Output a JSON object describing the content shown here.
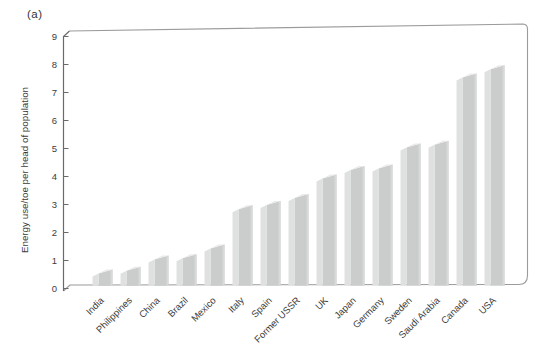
{
  "chart_data": {
    "type": "bar",
    "panel_label": "(a)",
    "title": "",
    "xlabel": "",
    "ylabel": "Energy use/toe per head of population",
    "categories": [
      "India",
      "Philippines",
      "China",
      "Brazil",
      "Mexico",
      "Italy",
      "Spain",
      "Former USSR",
      "UK",
      "Japan",
      "Germany",
      "Sweden",
      "Saudi Arabia",
      "Canada",
      "USA"
    ],
    "values": [
      0.3,
      0.4,
      0.8,
      0.85,
      1.2,
      2.6,
      2.75,
      3.0,
      3.7,
      4.0,
      4.05,
      4.8,
      4.9,
      7.3,
      7.6
    ],
    "ylim": [
      0,
      9
    ],
    "yticks": [
      0,
      1,
      2,
      3,
      4,
      5,
      6,
      7,
      8,
      9
    ],
    "grid": false,
    "legend": null,
    "bar_style": "3d-slab",
    "x_label_rotation_deg": -45,
    "colors": {
      "bar_front": "#dfe1e0",
      "bar_side": "#cbcdcc",
      "bar_top": "#e9eae9",
      "bar_edge_highlight": "#d8dad9",
      "frame": "#9b9b9b",
      "axis": "#6a6a6a",
      "text": "#3c3c3c",
      "background": "#ffffff"
    }
  }
}
